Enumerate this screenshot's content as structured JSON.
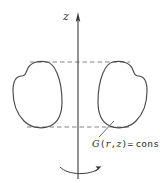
{
  "figure": {
    "background_color": "#ffffff",
    "line_color": "#4a4a4a",
    "dash_color": "#777777",
    "width_px": 160,
    "height_px": 183
  },
  "axis": {
    "label": "z",
    "name": "vertical-axis",
    "direction": "up",
    "x_px": 78,
    "top_px": 14,
    "bottom_px": 179,
    "arrow": "up-arrowhead"
  },
  "rotation": {
    "name": "rotation-arrow",
    "description": "curved arrow about axis",
    "direction": "clockwise-right",
    "y_px": 171
  },
  "contours": [
    {
      "name": "left-contour",
      "side": "left",
      "shape": "pear-shaped closed curve",
      "x_range_px": [
        13,
        62
      ],
      "y_range_px": [
        62,
        127
      ]
    },
    {
      "name": "right-contour",
      "side": "right",
      "shape": "pear-shaped closed curve (mirrored)",
      "x_range_px": [
        94,
        147
      ],
      "y_range_px": [
        62,
        127
      ]
    }
  ],
  "dashed_guides": [
    {
      "name": "top-tangent-guide",
      "y_px": 62,
      "x_start_px": 30,
      "x_end_px": 130
    },
    {
      "name": "bottom-tangent-guide",
      "y_px": 127,
      "x_start_px": 27,
      "x_end_px": 132
    }
  ],
  "annotation": {
    "name": "contour-value-label",
    "text_full": "G(r,z)= const",
    "function_symbol": "G",
    "open_paren": "(",
    "arg_r": "r",
    "comma": ",",
    "arg_z": "z",
    "close_paren": ")",
    "equals": "=",
    "value": "const",
    "leader": {
      "name": "leader-line",
      "from_px": [
        99,
        137
      ],
      "to_px": [
        114,
        121
      ]
    }
  }
}
